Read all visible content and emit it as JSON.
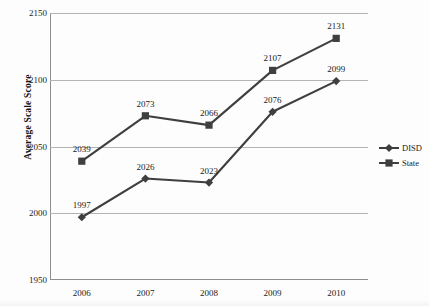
{
  "chart_data": {
    "type": "line",
    "title": "",
    "xlabel": "",
    "ylabel": "Average Scale Score",
    "categories": [
      "2006",
      "2007",
      "2008",
      "2009",
      "2010"
    ],
    "ylim": [
      1950,
      2150
    ],
    "ytick_step": 50,
    "yticks": [
      "2150",
      "2100",
      "2050",
      "2000",
      "1950"
    ],
    "grid": true,
    "legend_position": "right",
    "series": [
      {
        "name": "DISD",
        "marker": "diamond",
        "color": "#3f3f3f",
        "values": [
          1997,
          2026,
          2023,
          2076,
          2099
        ],
        "labels": [
          "1997",
          "2026",
          "2023",
          "2076",
          "2099"
        ]
      },
      {
        "name": "State",
        "marker": "square",
        "color": "#3f3f3f",
        "values": [
          2039,
          2073,
          2066,
          2107,
          2131
        ],
        "labels": [
          "2039",
          "2073",
          "2066",
          "2107",
          "2131"
        ]
      }
    ]
  },
  "legend": {
    "items": [
      {
        "label": "DISD"
      },
      {
        "label": "State"
      }
    ]
  },
  "colors": {
    "line": "#3f3f3f",
    "gridline": "#b4b4b4",
    "axis": "#8d8d8d",
    "text": "#1a1a1a",
    "background": "#fdfdfd"
  }
}
